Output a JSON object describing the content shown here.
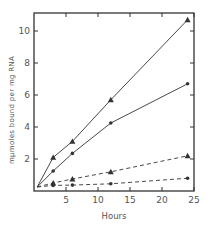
{
  "chart_data": {
    "type": "line",
    "title": "",
    "xlabel": "Hours",
    "ylabel": "mμmoles bound per mg RNA",
    "xlim": [
      0,
      25
    ],
    "ylim": [
      0,
      11
    ],
    "xticks": [
      5,
      10,
      15,
      20,
      25
    ],
    "xtick_labels": [
      "5",
      "10",
      "15",
      "20",
      "25"
    ],
    "yticks": [
      2,
      4,
      6,
      8,
      10
    ],
    "ytick_labels": [
      "2",
      "4",
      "6",
      "8",
      "10"
    ],
    "grid": false,
    "legend": null,
    "series": [
      {
        "name": "solid triangles",
        "marker": "triangle",
        "line_style": "solid",
        "x": [
          0.5,
          3,
          6,
          12,
          24
        ],
        "y": [
          0.25,
          2.1,
          3.1,
          5.7,
          10.7
        ]
      },
      {
        "name": "solid circles",
        "marker": "circle",
        "line_style": "solid",
        "x": [
          0.5,
          3,
          6,
          12,
          24
        ],
        "y": [
          0.25,
          1.25,
          2.35,
          4.25,
          6.7
        ]
      },
      {
        "name": "dashed triangles",
        "marker": "triangle",
        "line_style": "dashed",
        "x": [
          0.5,
          3,
          6,
          12,
          24
        ],
        "y": [
          0.25,
          0.5,
          0.75,
          1.2,
          2.2
        ]
      },
      {
        "name": "dashed circles",
        "marker": "circle",
        "line_style": "dashed",
        "x": [
          0.5,
          3,
          6,
          12,
          24
        ],
        "y": [
          0.25,
          0.35,
          0.37,
          0.45,
          0.8
        ]
      }
    ]
  },
  "colors": {
    "axis": "#333333",
    "line": "#333333",
    "text": "#555555"
  }
}
